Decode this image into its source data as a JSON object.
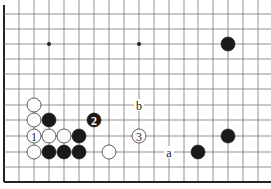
{
  "diagram": {
    "type": "go-board-fragment",
    "grid": {
      "x_lines": [
        4,
        19,
        34,
        49,
        64,
        79,
        94,
        109,
        124,
        139,
        154,
        169,
        184,
        198,
        213,
        228,
        243,
        258
      ],
      "y_lines": [
        14,
        29,
        44,
        59,
        74,
        89,
        105,
        120,
        136,
        152,
        167,
        182
      ],
      "left_edge": true,
      "bottom_edge": true,
      "extends_top": true,
      "extends_right": true
    },
    "hoshi": [
      {
        "x": 49,
        "y": 44
      },
      {
        "x": 139,
        "y": 44
      }
    ],
    "stones": [
      {
        "color": "black",
        "x": 228,
        "y": 44,
        "label": ""
      },
      {
        "color": "white",
        "x": 34,
        "y": 105,
        "label": ""
      },
      {
        "color": "white",
        "x": 34,
        "y": 120,
        "label": ""
      },
      {
        "color": "black",
        "x": 49,
        "y": 120,
        "label": ""
      },
      {
        "color": "black",
        "x": 94,
        "y": 120,
        "label": "2"
      },
      {
        "color": "white",
        "x": 34,
        "y": 136,
        "label": "1"
      },
      {
        "color": "white",
        "x": 49,
        "y": 136,
        "label": ""
      },
      {
        "color": "white",
        "x": 64,
        "y": 136,
        "label": ""
      },
      {
        "color": "black",
        "x": 79,
        "y": 136,
        "label": ""
      },
      {
        "color": "white",
        "x": 139,
        "y": 136,
        "label": "3"
      },
      {
        "color": "black",
        "x": 228,
        "y": 136,
        "label": ""
      },
      {
        "color": "white",
        "x": 34,
        "y": 152,
        "label": ""
      },
      {
        "color": "black",
        "x": 49,
        "y": 152,
        "label": ""
      },
      {
        "color": "black",
        "x": 64,
        "y": 152,
        "label": ""
      },
      {
        "color": "black",
        "x": 79,
        "y": 152,
        "label": ""
      },
      {
        "color": "white",
        "x": 109,
        "y": 152,
        "label": ""
      },
      {
        "color": "black",
        "x": 198,
        "y": 152,
        "label": ""
      }
    ],
    "point_labels": [
      {
        "text": "b",
        "x": 139,
        "y": 105
      },
      {
        "text": "a",
        "x": 169,
        "y": 152
      }
    ]
  }
}
